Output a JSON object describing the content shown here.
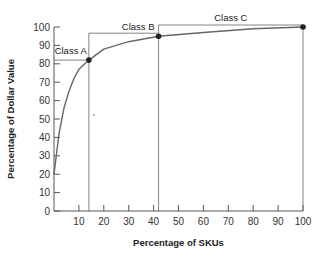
{
  "chart_data": {
    "type": "line",
    "title": "",
    "xlabel": "Percentage of SKUs",
    "ylabel": "Percentage of Dollar Value",
    "xlim": [
      0,
      100
    ],
    "ylim": [
      0,
      100
    ],
    "grid": false,
    "x_ticks": [
      10,
      20,
      30,
      40,
      50,
      60,
      70,
      80,
      90,
      100
    ],
    "y_ticks": [
      0,
      10,
      20,
      30,
      40,
      50,
      60,
      70,
      80,
      90,
      100
    ],
    "series": [
      {
        "name": "Cumulative dollar value curve",
        "x": [
          0,
          2,
          4,
          6,
          8,
          10,
          14,
          20,
          30,
          42,
          60,
          80,
          100
        ],
        "y": [
          20,
          42,
          56,
          65,
          72,
          77,
          82,
          88,
          92,
          95,
          97,
          99,
          100
        ]
      }
    ],
    "annotations": [
      {
        "label": "Class A",
        "x": 14,
        "y": 82
      },
      {
        "label": "Class B",
        "x": 42,
        "y": 95
      },
      {
        "label": "Class C",
        "x": 100,
        "y": 100
      }
    ]
  },
  "labels": {
    "xlabel": "Percentage of SKUs",
    "ylabel": "Percentage of Dollar Value",
    "class_a": "Class A",
    "class_b": "Class B",
    "class_c": "Class C"
  }
}
